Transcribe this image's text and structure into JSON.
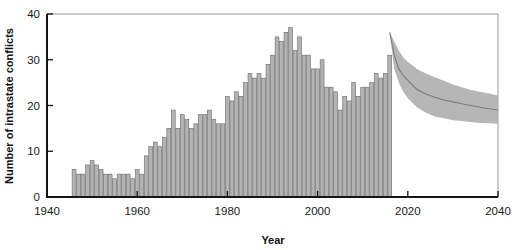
{
  "chart_data": {
    "type": "bar",
    "title": "",
    "xlabel": "Year",
    "ylabel": "Number of intrastate conflicts",
    "xlim": [
      1940,
      2040
    ],
    "ylim": [
      0,
      40
    ],
    "xticks": [
      1940,
      1960,
      1980,
      2000,
      2020,
      2040
    ],
    "xtick_labels": [
      "1940",
      "1960",
      "1980",
      "2000",
      "2020",
      "2040"
    ],
    "yticks": [
      0,
      10,
      20,
      30,
      40
    ],
    "ytick_labels": [
      "0",
      "10",
      "20",
      "30",
      "40"
    ],
    "grid": false,
    "legend": "none",
    "bar_color": "#b3b3b3",
    "bar_edge_color": "#6b6b6b",
    "projection_band_color": "#b0b0b0",
    "projection_median_color": "#7c7c7c",
    "categories": [
      1946,
      1947,
      1948,
      1949,
      1950,
      1951,
      1952,
      1953,
      1954,
      1955,
      1956,
      1957,
      1958,
      1959,
      1960,
      1961,
      1962,
      1963,
      1964,
      1965,
      1966,
      1967,
      1968,
      1969,
      1970,
      1971,
      1972,
      1973,
      1974,
      1975,
      1976,
      1977,
      1978,
      1979,
      1980,
      1981,
      1982,
      1983,
      1984,
      1985,
      1986,
      1987,
      1988,
      1989,
      1990,
      1991,
      1992,
      1993,
      1994,
      1995,
      1996,
      1997,
      1998,
      1999,
      2000,
      2001,
      2002,
      2003,
      2004,
      2005,
      2006,
      2007,
      2008,
      2009,
      2010,
      2011,
      2012,
      2013,
      2014,
      2015,
      2016
    ],
    "values": [
      6,
      5,
      5,
      7,
      8,
      7,
      6,
      5,
      5,
      4,
      5,
      5,
      5,
      4,
      6,
      5,
      9,
      11,
      12,
      11,
      13,
      15,
      19,
      15,
      18,
      17,
      15,
      16,
      18,
      18,
      19,
      17,
      16,
      16,
      22,
      21,
      23,
      22,
      25,
      27,
      26,
      27,
      26,
      29,
      31,
      35,
      34,
      36,
      37,
      32,
      35,
      31,
      31,
      28,
      28,
      30,
      24,
      24,
      23,
      19,
      22,
      21,
      25,
      22,
      24,
      24,
      25,
      27,
      26,
      27,
      31
    ],
    "projection": {
      "label": "projected range",
      "start_year": 2016,
      "end_year": 2040,
      "x": [
        2016,
        2017,
        2018,
        2019,
        2020,
        2021,
        2022,
        2024,
        2026,
        2028,
        2030,
        2032,
        2034,
        2036,
        2038,
        2040
      ],
      "median": [
        36,
        31,
        28,
        26.5,
        25.5,
        24.5,
        23.5,
        22.5,
        21.8,
        21.2,
        20.8,
        20.4,
        20.0,
        19.6,
        19.3,
        19.0
      ],
      "upper": [
        36,
        34,
        32,
        30.5,
        29.5,
        28.8,
        28.0,
        27.0,
        26.2,
        25.4,
        24.6,
        24.0,
        23.4,
        23.0,
        22.6,
        22.2
      ],
      "lower": [
        36,
        28,
        25,
        23.0,
        21.6,
        20.6,
        19.6,
        18.4,
        17.6,
        17.2,
        16.8,
        16.6,
        16.4,
        16.2,
        16.1,
        16.0
      ]
    }
  }
}
